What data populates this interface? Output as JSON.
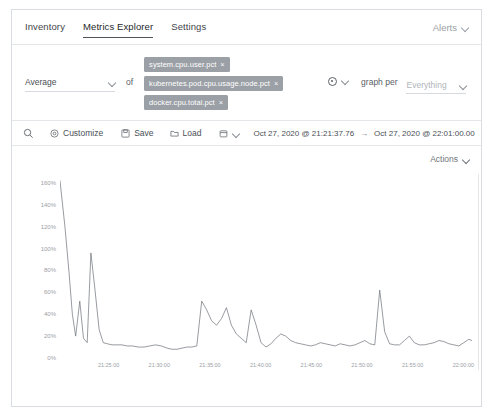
{
  "nav": {
    "items": [
      {
        "label": "Inventory",
        "active": false
      },
      {
        "label": "Metrics Explorer",
        "active": true
      },
      {
        "label": "Settings",
        "active": false
      }
    ],
    "right": {
      "label": "Alerts",
      "icon": "chevron-down-icon"
    }
  },
  "expression": {
    "aggregation": {
      "value": "Average",
      "icon": "chevron-down-icon"
    },
    "of_label": "of",
    "metrics": [
      {
        "label": "system.cpu.user.pct",
        "remove": "×"
      },
      {
        "label": "kubernetes.pod.cpu.usage.node.pct",
        "remove": "×"
      },
      {
        "label": "docker.cpu.total.pct",
        "remove": "×"
      }
    ],
    "add_metric_icon": "add-metric-circle-icon",
    "add_metric_chevron": "chevron-down-icon",
    "graph_per_label": "graph per",
    "graph_per": {
      "placeholder": "Everything",
      "value": "",
      "icon": "chevron-down-icon"
    }
  },
  "toolbar": {
    "search_icon": "search-icon",
    "customize": {
      "label": "Customize",
      "icon": "gear-icon"
    },
    "save": {
      "label": "Save",
      "icon": "save-disk-icon"
    },
    "load": {
      "label": "Load",
      "icon": "load-folder-icon"
    },
    "calendar_icon": "calendar-icon",
    "calendar_chevron": "chevron-down-icon",
    "date_start": "Oct 27, 2020 @ 21:21:37.76",
    "date_arrow": "→",
    "date_end": "Oct 27, 2020 @ 22:01:00.00"
  },
  "chart_panel": {
    "actions": {
      "label": "Actions",
      "icon": "chevron-down-icon"
    }
  },
  "chart_data": {
    "type": "line",
    "title": "",
    "xlabel": "",
    "ylabel": "",
    "grid": false,
    "legend": null,
    "ylim": [
      0,
      170
    ],
    "ytick_labels": [
      "160%",
      "140%",
      "120%",
      "100%",
      "80%",
      "60%",
      "40%",
      "20%",
      "0%"
    ],
    "ytick_values": [
      160,
      140,
      120,
      100,
      80,
      60,
      40,
      20,
      0
    ],
    "xtick_labels": [
      "21:25:00",
      "21:30:00",
      "21:35:00",
      "21:40:00",
      "21:45:00",
      "21:50:00",
      "21:55:00",
      "22:00:00"
    ],
    "xtick_positions": [
      0.118,
      0.241,
      0.364,
      0.487,
      0.61,
      0.733,
      0.856,
      0.979
    ],
    "series": [
      {
        "name": "Average of system.cpu.user.pct, kubernetes.pod.cpu.usage.node.pct, docker.cpu.total.pct",
        "color": "#6b7077",
        "x": [
          0.0,
          0.012,
          0.022,
          0.03,
          0.038,
          0.048,
          0.057,
          0.066,
          0.075,
          0.085,
          0.095,
          0.105,
          0.115,
          0.126,
          0.138,
          0.15,
          0.163,
          0.176,
          0.19,
          0.204,
          0.218,
          0.232,
          0.246,
          0.26,
          0.272,
          0.284,
          0.296,
          0.308,
          0.32,
          0.332,
          0.344,
          0.356,
          0.368,
          0.38,
          0.392,
          0.404,
          0.416,
          0.428,
          0.44,
          0.452,
          0.464,
          0.476,
          0.488,
          0.5,
          0.512,
          0.524,
          0.536,
          0.548,
          0.56,
          0.572,
          0.584,
          0.596,
          0.608,
          0.62,
          0.632,
          0.644,
          0.656,
          0.668,
          0.68,
          0.692,
          0.704,
          0.716,
          0.728,
          0.74,
          0.752,
          0.764,
          0.776,
          0.788,
          0.8,
          0.812,
          0.824,
          0.836,
          0.848,
          0.86,
          0.872,
          0.884,
          0.896,
          0.908,
          0.92,
          0.932,
          0.944,
          0.956,
          0.968,
          0.98,
          0.992,
          1.0
        ],
        "y": [
          162,
          120,
          78,
          40,
          20,
          52,
          18,
          14,
          96,
          62,
          26,
          14,
          13,
          12,
          12,
          12,
          11,
          11,
          10,
          10,
          11,
          12,
          11,
          9,
          8,
          8,
          9,
          10,
          10,
          11,
          52,
          44,
          34,
          30,
          36,
          46,
          30,
          22,
          18,
          14,
          44,
          30,
          14,
          10,
          13,
          18,
          22,
          20,
          16,
          14,
          13,
          12,
          11,
          12,
          14,
          13,
          12,
          11,
          13,
          12,
          11,
          12,
          14,
          16,
          13,
          12,
          62,
          24,
          13,
          12,
          12,
          16,
          20,
          14,
          12,
          12,
          13,
          14,
          16,
          15,
          13,
          12,
          11,
          14,
          17,
          16
        ]
      }
    ]
  }
}
